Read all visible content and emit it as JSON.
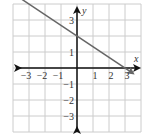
{
  "chart_data": {
    "type": "line",
    "title": "",
    "xlabel": "x",
    "ylabel": "y",
    "xlim": [
      -4,
      4
    ],
    "ylim": [
      -4,
      4
    ],
    "grid": true,
    "x_ticks": [
      -3,
      -2,
      -1,
      1,
      2,
      3
    ],
    "y_ticks": [
      3,
      1,
      -1,
      -2,
      -3
    ],
    "x_tick_labels": [
      "−3",
      "−2",
      "−1",
      "1",
      "2",
      "3"
    ],
    "y_tick_labels": [
      "3",
      "1",
      "−1",
      "−2",
      "−3"
    ],
    "series": [
      {
        "name": "line",
        "equation": "y = -2/3 x + 2",
        "slope": -0.6667,
        "y_intercept": 2,
        "x_intercept": 3,
        "points": [
          [
            -3.5,
            4.33
          ],
          [
            0,
            2
          ],
          [
            3,
            0
          ],
          [
            3.5,
            -0.33
          ]
        ],
        "arrows": "both",
        "color": "#666666"
      }
    ],
    "axis_color": "#111111",
    "grid_color": "#cccccc"
  }
}
